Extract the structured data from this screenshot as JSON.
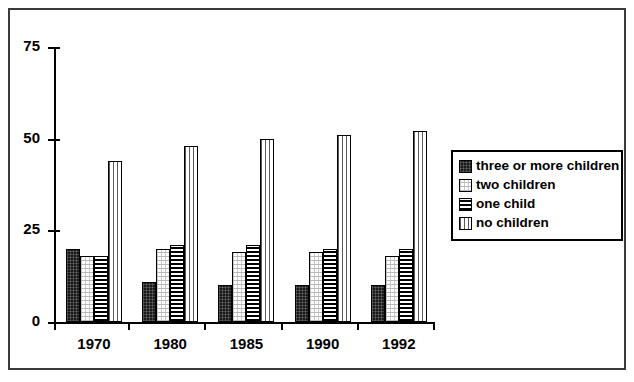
{
  "chart_data": {
    "type": "bar",
    "title": "",
    "xlabel": "",
    "ylabel": "",
    "categories": [
      "1970",
      "1980",
      "1985",
      "1990",
      "1992"
    ],
    "ylim": [
      0,
      75
    ],
    "yticks": [
      0,
      25,
      50,
      75
    ],
    "ytick_labels": [
      "0",
      "25",
      "50",
      "75"
    ],
    "grid": false,
    "legend_position": "right",
    "series": [
      {
        "name": "three or more children",
        "pattern": "solid-black",
        "values": [
          20,
          11,
          10,
          10,
          10
        ]
      },
      {
        "name": "two children",
        "pattern": "fine-dots",
        "values": [
          18,
          20,
          19,
          19,
          18
        ]
      },
      {
        "name": "one child",
        "pattern": "horizontal-lines",
        "values": [
          18,
          21,
          21,
          20,
          20
        ]
      },
      {
        "name": "no children",
        "pattern": "vertical-lines",
        "values": [
          44,
          48,
          50,
          51,
          52
        ]
      }
    ]
  },
  "legend": {
    "items": [
      {
        "label": "three or more children",
        "pattern": "solid-black"
      },
      {
        "label": "two children",
        "pattern": "fine-dots"
      },
      {
        "label": "one child",
        "pattern": "horizontal-lines"
      },
      {
        "label": "no children",
        "pattern": "vertical-lines"
      }
    ]
  },
  "colors": {
    "frame": "#3a3a3a",
    "axis": "#000000",
    "bar_outline": "#000000",
    "background": "#ffffff"
  }
}
